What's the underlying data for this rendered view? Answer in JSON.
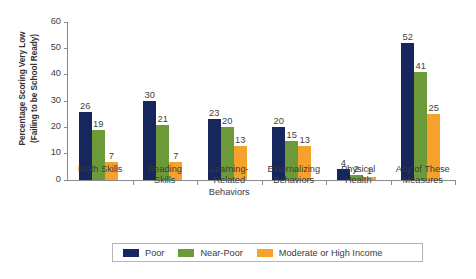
{
  "chart_data": {
    "type": "bar",
    "title": "",
    "subtitle": "",
    "xlabel": "",
    "ylabel": "Percentage Scoring Very Low (Failing to be School Ready)",
    "ylabel_lines": [
      "Percentage Scoring Very Low",
      "(Failing to be School Ready)"
    ],
    "ylim": [
      0,
      60
    ],
    "yticks": [
      0,
      10,
      20,
      30,
      40,
      50,
      60
    ],
    "grid": false,
    "legend_position": "bottom",
    "categories": [
      "Math Skills",
      "Reading Skills",
      "Learning-Related Behaviors",
      "Externalizing Behaviors",
      "Physical Health",
      "Any of These Measures"
    ],
    "category_lines": [
      [
        "Math Skills"
      ],
      [
        "Reading",
        "Skills"
      ],
      [
        "Learning-",
        "Related",
        "Behaviors"
      ],
      [
        "Externalizing",
        "Behaviors"
      ],
      [
        "Physical",
        "Health"
      ],
      [
        "Any of These",
        "Measures"
      ]
    ],
    "series": [
      {
        "name": "Poor",
        "color": "#17265c",
        "values": [
          26,
          30,
          23,
          20,
          4,
          52
        ]
      },
      {
        "name": "Near-Poor",
        "color": "#6d9a38",
        "values": [
          19,
          21,
          20,
          15,
          2,
          41
        ]
      },
      {
        "name": "Moderate or High Income",
        "color": "#f5a22d",
        "values": [
          7,
          7,
          13,
          13,
          1,
          25
        ]
      }
    ]
  },
  "colors": {
    "poor": "#17265c",
    "near_poor": "#6d9a38",
    "moderate_high": "#f5a22d",
    "axis": "#8a8a8a",
    "text": "#3a3a3a",
    "legend_border": "#b4b4b4",
    "background": "#ffffff"
  }
}
